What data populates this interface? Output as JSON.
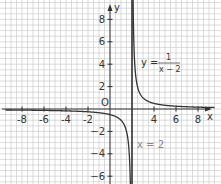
{
  "chart_data": {
    "type": "line",
    "title": "",
    "xlabel": "x",
    "ylabel": "y",
    "origin_label": "O",
    "xlim": [
      -9.5,
      9.5
    ],
    "ylim": [
      -6.7,
      9.7
    ],
    "grid": true,
    "grid_step": 0.5,
    "x_ticks": [
      -8,
      -6,
      -4,
      -2,
      4,
      6,
      8
    ],
    "y_ticks": [
      8,
      6,
      4,
      2,
      -2,
      -4,
      -6
    ],
    "x_tick_labels": [
      "-8",
      "-6",
      "-4",
      "-2",
      "4",
      "6",
      "8"
    ],
    "y_tick_labels": [
      "8",
      "6",
      "4",
      "2",
      "−2",
      "−4",
      "−6"
    ],
    "series": [
      {
        "name": "y = 1/(x − 2)",
        "function": "1/(x-2)",
        "asymptote_x": 2
      }
    ],
    "annotations": [
      {
        "text_lhs": "y =",
        "numerator": "1",
        "denominator": "x − 2",
        "kind": "function-label"
      },
      {
        "text": "x = 2",
        "kind": "asymptote-label",
        "color": "#888888"
      }
    ],
    "asymptote": {
      "x": 2
    }
  }
}
